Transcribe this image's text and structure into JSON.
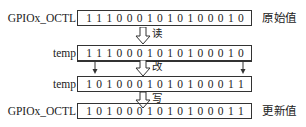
{
  "diagram": {
    "title": "",
    "rows": [
      {
        "id": "original",
        "label": "GPIOx_OCTL",
        "bits": [
          "1",
          "1",
          "1",
          "0",
          "0",
          "0",
          "1",
          "0",
          "1",
          "0",
          "1",
          "0",
          "0",
          "0",
          "1",
          "0"
        ],
        "note": "原始值"
      },
      {
        "id": "temp-read",
        "label": "temp",
        "bits": [
          "1",
          "1",
          "1",
          "0",
          "0",
          "0",
          "1",
          "0",
          "1",
          "0",
          "1",
          "0",
          "0",
          "0",
          "1",
          "0"
        ],
        "note": ""
      },
      {
        "id": "temp-modified",
        "label": "temp",
        "bits": [
          "1",
          "0",
          "1",
          "0",
          "0",
          "0",
          "1",
          "0",
          "1",
          "0",
          "1",
          "0",
          "0",
          "0",
          "1",
          "1"
        ],
        "note": ""
      },
      {
        "id": "updated",
        "label": "GPIOx_OCTL",
        "bits": [
          "1",
          "0",
          "1",
          "0",
          "0",
          "0",
          "1",
          "0",
          "1",
          "0",
          "1",
          "0",
          "0",
          "0",
          "1",
          "1"
        ],
        "note": "更新值"
      }
    ],
    "steps": [
      {
        "id": "read",
        "label": "读"
      },
      {
        "id": "modify",
        "label": "改"
      },
      {
        "id": "write",
        "label": "写"
      }
    ],
    "modified_bit_positions": [
      1,
      15
    ]
  }
}
